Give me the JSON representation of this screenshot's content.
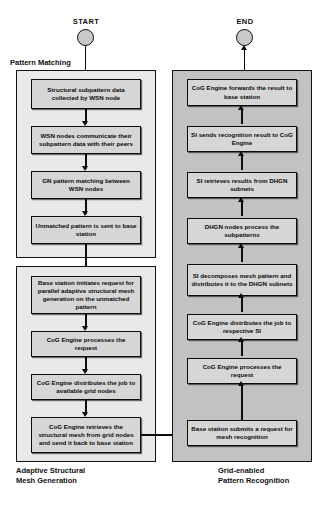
{
  "diagram": {
    "title_start": "START",
    "title_end": "END",
    "groups": [
      {
        "id": "pattern-matching",
        "label": "Pattern Matching",
        "label_position": "top-left-outside"
      },
      {
        "id": "adaptive-structural-mesh-generation",
        "label": "Adaptive Structural\nMesh Generation",
        "label_position": "bottom-left-outside"
      },
      {
        "id": "grid-enabled-pattern-recognition",
        "label": "Grid-enabled\nPattern Recognition",
        "label_position": "bottom-right-outside"
      }
    ],
    "left_column": {
      "pattern_matching_nodes": [
        "Structural subpattern data collected by WSN node",
        "WSN nodes communicate their subpattern data with their peers",
        "GN pattern matching between WSN nodes",
        "Unmatched pattern is sent to base station"
      ],
      "mesh_generation_nodes": [
        "Base station initiates request for parallel adaptive structural mesh generation on the unmatched pattern",
        "CoG Engine processes the request",
        "CoG Engine distributes the job to available grid nodes",
        "CoG Engine retrieves  the structural mesh from grid nodes and send it back to base station"
      ]
    },
    "right_column": {
      "pattern_recognition_nodes": [
        "CoG Engine forwards the result to base station",
        "SI sends recognition result to CoG Engine",
        "SI retrieves results from DHGN subnets",
        "DHGN nodes process the subpatterns",
        "SI decomposes mesh pattern and distributes it to the DHGN subnets",
        "CoG Engine distributes the job to respective SI",
        "CoG Engine processes the request",
        "Base station submits a request for mesh recognition"
      ]
    },
    "colors": {
      "node_fill": "#d6d6d6",
      "group_fill": "#e9e9e9",
      "group_fill_shaded": "#c2c2c2",
      "stroke": "#0d0d0d",
      "terminal_fill": "#c9c9c9"
    }
  }
}
